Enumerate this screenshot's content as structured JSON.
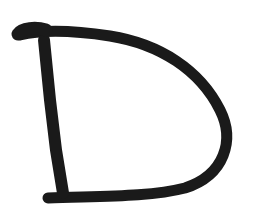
{
  "image": {
    "subject": "Hand-drawn letter",
    "letter": "D",
    "stroke_color": "#1a1a1a",
    "background_color": "#ffffff"
  }
}
